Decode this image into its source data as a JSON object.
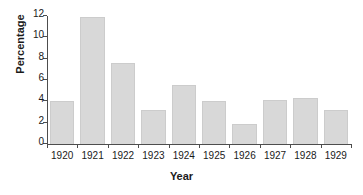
{
  "chart_data": {
    "type": "bar",
    "title": "",
    "xlabel": "Year",
    "ylabel": "Percentage",
    "categories": [
      "1920",
      "1921",
      "1922",
      "1923",
      "1924",
      "1925",
      "1926",
      "1927",
      "1928",
      "1929"
    ],
    "values": [
      4.0,
      11.9,
      7.6,
      3.2,
      5.5,
      4.0,
      1.9,
      4.1,
      4.35,
      3.2
    ],
    "ylim": [
      0,
      12
    ],
    "yticks": [
      0,
      2,
      4,
      6,
      8,
      10,
      12
    ],
    "ytick_labels": [
      "0",
      "2",
      "4",
      "6",
      "8",
      "10",
      "12"
    ],
    "grid": false,
    "legend": null,
    "bar_color": "#d8d8d8",
    "bar_border_color": "#cccccc",
    "axis_color": "#4d4d4d",
    "text_color": "#1a1a1a",
    "background": "#ffffff"
  }
}
